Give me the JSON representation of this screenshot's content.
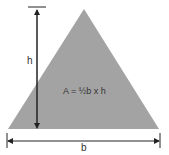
{
  "diagram": {
    "formula": "A = ½b x h",
    "height_label": "h",
    "base_label": "b",
    "colors": {
      "triangle_fill": "#a3a3a3",
      "lines": "#222222",
      "text": "#333333"
    }
  }
}
